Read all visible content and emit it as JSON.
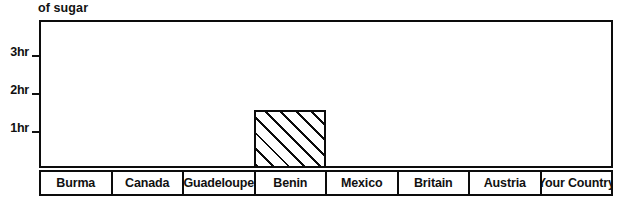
{
  "chart_data": {
    "type": "bar",
    "title": "of sugar",
    "xlabel": "",
    "ylabel": "",
    "categories": [
      "Burma",
      "Canada",
      "Guadeloupe",
      "Benin",
      "Mexico",
      "Britain",
      "Austria",
      "Your Country"
    ],
    "values": [
      0,
      0,
      0,
      1.45,
      0,
      0,
      0,
      0
    ],
    "unit": "hr",
    "ylim": [
      0,
      3.9
    ],
    "yticks": [
      1,
      2,
      3
    ],
    "ytick_labels": [
      "1hr",
      "2hr",
      "3hr"
    ],
    "grid": false,
    "legend": null,
    "bar_style": "diagonal-hatch"
  },
  "caption": {
    "text": "of sugar"
  },
  "axis": {
    "ticks": [
      {
        "label": "3hr",
        "value": 3
      },
      {
        "label": "2hr",
        "value": 2
      },
      {
        "label": "1hr",
        "value": 1
      }
    ]
  },
  "columns": [
    {
      "label": "Burma",
      "value": 0
    },
    {
      "label": "Canada",
      "value": 0
    },
    {
      "label": "Guadeloupe",
      "value": 0
    },
    {
      "label": "Benin",
      "value": 1.45
    },
    {
      "label": "Mexico",
      "value": 0
    },
    {
      "label": "Britain",
      "value": 0
    },
    {
      "label": "Austria",
      "value": 0
    },
    {
      "label": "Your Country",
      "value": 0
    }
  ],
  "colors": {
    "ink": "#0c0c0c",
    "paper": "#ffffff"
  }
}
